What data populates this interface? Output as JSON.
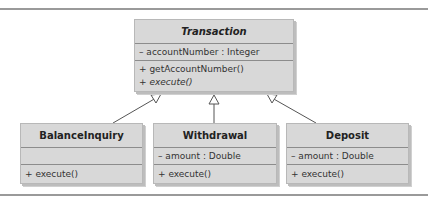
{
  "diagram": {
    "type": "UML class diagram",
    "colors": {
      "box_fill": "#d8d8d8",
      "divider": "#8c8c8c",
      "connector": "#555555",
      "rule": "#9a9a9a"
    },
    "classes": {
      "transaction": {
        "name": "Transaction",
        "abstract": true,
        "attributes": [
          "– accountNumber : Integer"
        ],
        "operations": [
          "+ getAccountNumber()",
          "+ execute()"
        ]
      },
      "balance_inquiry": {
        "name": "BalanceInquiry",
        "attributes": [],
        "operations": [
          "+ execute()"
        ]
      },
      "withdrawal": {
        "name": "Withdrawal",
        "attributes": [
          "– amount : Double"
        ],
        "operations": [
          "+ execute()"
        ]
      },
      "deposit": {
        "name": "Deposit",
        "attributes": [
          "– amount : Double"
        ],
        "operations": [
          "+ execute()"
        ]
      }
    },
    "relationships": [
      {
        "type": "generalization",
        "from": "BalanceInquiry",
        "to": "Transaction"
      },
      {
        "type": "generalization",
        "from": "Withdrawal",
        "to": "Transaction"
      },
      {
        "type": "generalization",
        "from": "Deposit",
        "to": "Transaction"
      }
    ]
  }
}
